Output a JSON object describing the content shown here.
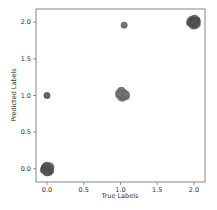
{
  "chart_data": {
    "type": "scatter",
    "title": "",
    "xlabel": "True Labels",
    "ylabel": "Predicted Labels",
    "xlim": [
      -0.15,
      2.15
    ],
    "ylim": [
      -0.18,
      2.18
    ],
    "xticks": [
      0.0,
      0.5,
      1.0,
      1.5,
      2.0
    ],
    "yticks": [
      0.0,
      0.5,
      1.0,
      1.5,
      2.0
    ],
    "xtick_labels": [
      "0.0",
      "0.5",
      "1.0",
      "1.5",
      "2.0"
    ],
    "ytick_labels": [
      "0.0",
      "0.5",
      "1.0",
      "1.5",
      "2.0"
    ],
    "grid": false,
    "legend": null,
    "series": [
      {
        "name": "clusters (jittered)",
        "points": [
          {
            "x": 0.0,
            "y": 0.0,
            "count": "many",
            "color": "#555555"
          },
          {
            "x": 0.0,
            "y": 1.0,
            "count": 1,
            "color": "#555555"
          },
          {
            "x": 1.03,
            "y": 1.02,
            "count": "many",
            "color": "#777777"
          },
          {
            "x": 1.05,
            "y": 1.96,
            "count": 1,
            "color": "#666666"
          },
          {
            "x": 2.0,
            "y": 2.0,
            "count": "many",
            "color": "#555555"
          }
        ]
      }
    ]
  }
}
